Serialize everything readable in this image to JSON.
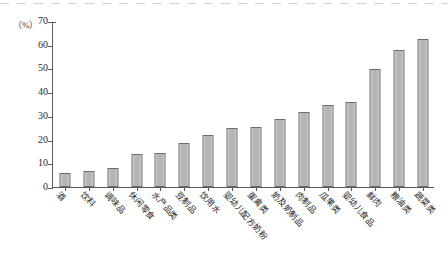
{
  "chart_data": {
    "type": "bar",
    "title": "",
    "subtitle": "",
    "xlabel": "",
    "ylabel": "（%）",
    "unit_label": "（%）",
    "ylim": [
      0,
      70
    ],
    "ytick_step": 10,
    "yticks": [
      0,
      10,
      20,
      30,
      40,
      50,
      60,
      70
    ],
    "ytick_labels": [
      "0",
      "10",
      "20",
      "30",
      "40",
      "50",
      "60",
      "70"
    ],
    "grid": false,
    "legend": "none",
    "bar_fill_color": "#b8b8b8",
    "bar_border_color": "#6d6d6d",
    "axis_color": "#555a5e",
    "categories": [
      "酒",
      "饮料",
      "调味品",
      "休闲零食",
      "水产品类",
      "豆制品",
      "饮用水",
      "婴幼儿配方奶粉",
      "蛋禽类",
      "奶及奶制品",
      "肉制品",
      "瓜果类",
      "婴幼儿食品",
      "鲜肉",
      "粮油类",
      "蔬菜类"
    ],
    "values": [
      6,
      7,
      8,
      14,
      14.5,
      18.5,
      22,
      25,
      25.5,
      29,
      32,
      35,
      36,
      50,
      58,
      63
    ]
  }
}
